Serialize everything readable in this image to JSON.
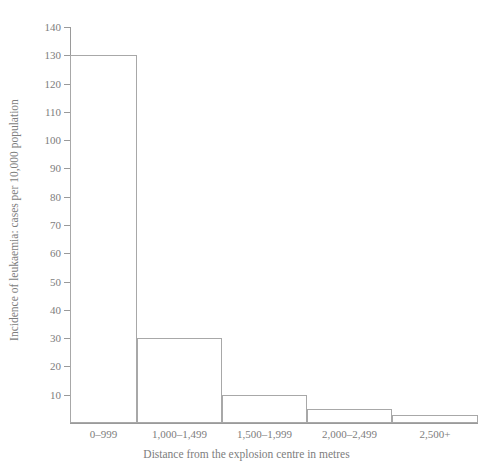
{
  "chart_data": {
    "type": "bar",
    "title": "",
    "subtitle": "",
    "xlabel": "Distance from the explosion centre in metres",
    "ylabel": "Incidence of leukaemia: cases per 10,000 population",
    "categories": [
      "0–999",
      "1,000–1,499",
      "1,500–1,999",
      "2,000–2,499",
      "2,500+"
    ],
    "values": [
      130,
      30,
      10,
      5,
      3
    ],
    "bar_widths": [
      67,
      85,
      85,
      85,
      86
    ],
    "ylim": [
      0,
      140
    ],
    "y_ticks": [
      0,
      10,
      20,
      30,
      40,
      50,
      60,
      70,
      80,
      90,
      100,
      110,
      120,
      130,
      140
    ],
    "y_tick_labels": [
      "",
      "10",
      "20",
      "30",
      "40",
      "50",
      "60",
      "70",
      "80",
      "90",
      "100",
      "110",
      "120",
      "130",
      "140"
    ],
    "grid": false,
    "legend": null,
    "legend_position": "none",
    "series": [
      {
        "name": "Incidence of leukaemia",
        "values": [
          130,
          30,
          10,
          5,
          3
        ]
      }
    ],
    "style": {
      "bar_fill": "#ffffff",
      "bar_outline": "#a8a8a8",
      "axis_color": "#9a9a9a",
      "text_color": "#7d7d7d",
      "background": "#ffffff"
    }
  }
}
